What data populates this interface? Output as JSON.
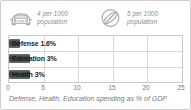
{
  "widget": {
    "border_color": "#cfcfcf",
    "background": "#ffffff"
  },
  "stats": [
    {
      "icon": "car-icon",
      "line1": "4 per 1000",
      "line2": "population",
      "value": 4,
      "unit": "per 1000 population"
    },
    {
      "icon": "satellite-dish-icon",
      "line1": "5 per 1000",
      "line2": "population",
      "value": 5,
      "unit": "per 1000 population"
    }
  ],
  "chart_data": {
    "type": "bar",
    "orientation": "horizontal",
    "title": "",
    "categories": [
      "Defense",
      "Education",
      "Health"
    ],
    "values": [
      1.6,
      3,
      3
    ],
    "bar_labels": [
      "Defense 1.6%",
      "Education 3%",
      "Health 3%"
    ],
    "xlabel": "",
    "ylabel": "",
    "xlim": [
      0,
      25
    ],
    "xticks": [
      0,
      5,
      10,
      15,
      20,
      25
    ],
    "xtick_labels": [
      "0",
      "5",
      "10",
      "15",
      "20",
      "25"
    ],
    "grid": true,
    "legend": false,
    "bar_color": "#3a3a3a",
    "gridline_color": "#d8d8d8",
    "caption": "Defense, Health, Education spending as % of GDP"
  }
}
